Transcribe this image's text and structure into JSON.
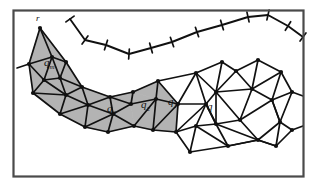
{
  "figure": {
    "kind": "triangulated-mesh-diagram",
    "caption_labels": [
      "r",
      "q_m",
      "q_3",
      "q_2",
      "q_1",
      "q"
    ],
    "background_color": "#ffffff",
    "frame_color": "#4a4a4a",
    "shade_color": "#b3b3b3",
    "edge_color": "#111111",
    "vertex_color": "#111111"
  },
  "frame": {
    "x": 13.5,
    "y": 10.5,
    "width": 290,
    "height": 166,
    "stroke_width": 2.2
  },
  "labels": [
    {
      "name": "label-r",
      "text": "r",
      "x": 36,
      "y": 21,
      "class": "label-r"
    },
    {
      "name": "label-qm",
      "text": "q",
      "sub": "m",
      "x": 44,
      "y": 66,
      "class": "label-main"
    },
    {
      "name": "label-q3",
      "text": "q",
      "sub": "3",
      "x": 107,
      "y": 112,
      "class": "label-main"
    },
    {
      "name": "label-q2",
      "text": "q",
      "sub": "2",
      "x": 141,
      "y": 108,
      "class": "label-main"
    },
    {
      "name": "label-q1",
      "text": "q",
      "sub": "1",
      "x": 168,
      "y": 105,
      "class": "label-main"
    },
    {
      "name": "label-q",
      "text": "q",
      "sub": "",
      "x": 207,
      "y": 110,
      "class": "label-main"
    }
  ],
  "shaded_polygons": [
    [
      [
        40,
        28
      ],
      [
        29,
        64
      ],
      [
        52,
        57
      ]
    ],
    [
      [
        40,
        28
      ],
      [
        52,
        57
      ],
      [
        66,
        62
      ]
    ],
    [
      [
        29,
        64
      ],
      [
        52,
        57
      ],
      [
        44,
        80
      ]
    ],
    [
      [
        52,
        57
      ],
      [
        66,
        62
      ],
      [
        60,
        78
      ]
    ],
    [
      [
        52,
        57
      ],
      [
        60,
        78
      ],
      [
        44,
        80
      ]
    ],
    [
      [
        44,
        80
      ],
      [
        60,
        78
      ],
      [
        66,
        95
      ]
    ],
    [
      [
        29,
        64
      ],
      [
        44,
        80
      ],
      [
        33,
        93
      ]
    ],
    [
      [
        33,
        93
      ],
      [
        44,
        80
      ],
      [
        66,
        95
      ]
    ],
    [
      [
        60,
        78
      ],
      [
        66,
        95
      ],
      [
        82,
        87
      ]
    ],
    [
      [
        66,
        62
      ],
      [
        60,
        78
      ],
      [
        82,
        87
      ]
    ],
    [
      [
        33,
        93
      ],
      [
        66,
        95
      ],
      [
        60,
        114
      ]
    ],
    [
      [
        66,
        95
      ],
      [
        82,
        87
      ],
      [
        88,
        105
      ]
    ],
    [
      [
        66,
        95
      ],
      [
        88,
        105
      ],
      [
        60,
        114
      ]
    ],
    [
      [
        60,
        114
      ],
      [
        88,
        105
      ],
      [
        85,
        127
      ]
    ],
    [
      [
        88,
        105
      ],
      [
        110,
        97
      ],
      [
        113,
        114
      ]
    ],
    [
      [
        82,
        87
      ],
      [
        110,
        97
      ],
      [
        88,
        105
      ]
    ],
    [
      [
        88,
        105
      ],
      [
        113,
        114
      ],
      [
        85,
        127
      ]
    ],
    [
      [
        85,
        127
      ],
      [
        113,
        114
      ],
      [
        108,
        132
      ]
    ],
    [
      [
        110,
        97
      ],
      [
        131,
        104
      ],
      [
        113,
        114
      ]
    ],
    [
      [
        113,
        114
      ],
      [
        131,
        104
      ],
      [
        134,
        126
      ]
    ],
    [
      [
        113,
        114
      ],
      [
        134,
        126
      ],
      [
        108,
        132
      ]
    ],
    [
      [
        110,
        97
      ],
      [
        133,
        92
      ],
      [
        131,
        104
      ]
    ],
    [
      [
        131,
        104
      ],
      [
        156,
        99
      ],
      [
        134,
        126
      ]
    ],
    [
      [
        133,
        92
      ],
      [
        156,
        99
      ],
      [
        131,
        104
      ]
    ],
    [
      [
        134,
        126
      ],
      [
        156,
        99
      ],
      [
        153,
        130
      ]
    ],
    [
      [
        133,
        92
      ],
      [
        158,
        81
      ],
      [
        156,
        99
      ]
    ],
    [
      [
        156,
        99
      ],
      [
        178,
        104
      ],
      [
        153,
        130
      ]
    ],
    [
      [
        156,
        99
      ],
      [
        158,
        81
      ],
      [
        178,
        104
      ]
    ],
    [
      [
        153,
        130
      ],
      [
        178,
        104
      ],
      [
        176,
        132
      ]
    ]
  ],
  "mesh_edges": [
    [
      40,
      28,
      29,
      64
    ],
    [
      40,
      28,
      52,
      57
    ],
    [
      40,
      28,
      66,
      62
    ],
    [
      29,
      64,
      52,
      57
    ],
    [
      52,
      57,
      66,
      62
    ],
    [
      17,
      68,
      29,
      64
    ],
    [
      29,
      64,
      44,
      80
    ],
    [
      52,
      57,
      44,
      80
    ],
    [
      52,
      57,
      60,
      78
    ],
    [
      66,
      62,
      60,
      78
    ],
    [
      44,
      80,
      60,
      78
    ],
    [
      29,
      64,
      33,
      93
    ],
    [
      44,
      80,
      33,
      93
    ],
    [
      44,
      80,
      66,
      95
    ],
    [
      60,
      78,
      66,
      95
    ],
    [
      33,
      93,
      66,
      95
    ],
    [
      60,
      78,
      82,
      87
    ],
    [
      66,
      95,
      82,
      87
    ],
    [
      66,
      62,
      82,
      87
    ],
    [
      33,
      93,
      60,
      114
    ],
    [
      66,
      95,
      60,
      114
    ],
    [
      66,
      95,
      88,
      105
    ],
    [
      82,
      87,
      88,
      105
    ],
    [
      60,
      114,
      88,
      105
    ],
    [
      60,
      114,
      85,
      127
    ],
    [
      88,
      105,
      85,
      127
    ],
    [
      82,
      87,
      110,
      97
    ],
    [
      88,
      105,
      110,
      97
    ],
    [
      88,
      105,
      113,
      114
    ],
    [
      110,
      97,
      113,
      114
    ],
    [
      85,
      127,
      113,
      114
    ],
    [
      85,
      127,
      108,
      132
    ],
    [
      113,
      114,
      108,
      132
    ],
    [
      110,
      97,
      131,
      104
    ],
    [
      113,
      114,
      131,
      104
    ],
    [
      113,
      114,
      134,
      126
    ],
    [
      108,
      132,
      134,
      126
    ],
    [
      110,
      97,
      133,
      92
    ],
    [
      131,
      104,
      133,
      92
    ],
    [
      131,
      104,
      156,
      99
    ],
    [
      134,
      126,
      156,
      99
    ],
    [
      134,
      126,
      153,
      130
    ],
    [
      153,
      130,
      156,
      99
    ],
    [
      133,
      92,
      158,
      81
    ],
    [
      156,
      99,
      158,
      81
    ],
    [
      156,
      99,
      178,
      104
    ],
    [
      153,
      130,
      178,
      104
    ],
    [
      153,
      130,
      176,
      132
    ],
    [
      176,
      132,
      178,
      104
    ],
    [
      158,
      81,
      178,
      104
    ],
    [
      178,
      104,
      206,
      104
    ],
    [
      176,
      132,
      206,
      104
    ],
    [
      178,
      104,
      196,
      73
    ],
    [
      196,
      73,
      206,
      104
    ],
    [
      158,
      81,
      196,
      73
    ],
    [
      196,
      73,
      222,
      62
    ],
    [
      196,
      73,
      216,
      92
    ],
    [
      206,
      104,
      216,
      92
    ],
    [
      222,
      62,
      216,
      92
    ],
    [
      216,
      92,
      236,
      71
    ],
    [
      222,
      62,
      236,
      71
    ],
    [
      236,
      71,
      258,
      60
    ],
    [
      236,
      71,
      252,
      89
    ],
    [
      216,
      92,
      252,
      89
    ],
    [
      252,
      89,
      258,
      60
    ],
    [
      258,
      60,
      281,
      72
    ],
    [
      252,
      89,
      281,
      72
    ],
    [
      252,
      89,
      272,
      100
    ],
    [
      281,
      72,
      272,
      100
    ],
    [
      272,
      100,
      292,
      92
    ],
    [
      281,
      72,
      292,
      92
    ],
    [
      272,
      100,
      280,
      122
    ],
    [
      292,
      92,
      280,
      122
    ],
    [
      206,
      104,
      216,
      124
    ],
    [
      216,
      92,
      216,
      124
    ],
    [
      216,
      124,
      240,
      120
    ],
    [
      216,
      92,
      240,
      120
    ],
    [
      240,
      120,
      252,
      89
    ],
    [
      240,
      120,
      272,
      100
    ],
    [
      240,
      120,
      258,
      140
    ],
    [
      216,
      124,
      258,
      140
    ],
    [
      206,
      104,
      216,
      124
    ],
    [
      216,
      124,
      228,
      146
    ],
    [
      228,
      146,
      258,
      140
    ],
    [
      206,
      104,
      196,
      126
    ],
    [
      196,
      126,
      216,
      124
    ],
    [
      196,
      126,
      228,
      146
    ],
    [
      176,
      132,
      196,
      126
    ],
    [
      176,
      132,
      190,
      152
    ],
    [
      190,
      152,
      196,
      126
    ],
    [
      190,
      152,
      228,
      146
    ],
    [
      258,
      140,
      280,
      122
    ],
    [
      258,
      140,
      276,
      146
    ],
    [
      276,
      146,
      280,
      122
    ],
    [
      276,
      146,
      292,
      130
    ],
    [
      280,
      122,
      292,
      130
    ],
    [
      258,
      140,
      276,
      146
    ],
    [
      272,
      100,
      280,
      122
    ],
    [
      292,
      92,
      303,
      96
    ],
    [
      292,
      130,
      303,
      126
    ],
    [
      228,
      146,
      258,
      140
    ]
  ],
  "upper_polyline": [
    [
      70,
      19
    ],
    [
      85,
      40
    ],
    [
      106,
      45
    ],
    [
      129,
      54
    ],
    [
      151,
      48
    ],
    [
      172,
      42
    ],
    [
      197,
      32
    ],
    [
      222,
      25
    ],
    [
      248,
      17
    ],
    [
      268,
      15
    ],
    [
      288,
      26
    ],
    [
      303,
      37
    ]
  ],
  "mesh_vertices": [
    [
      40,
      28
    ],
    [
      29,
      64
    ],
    [
      52,
      57
    ],
    [
      66,
      62
    ],
    [
      44,
      80
    ],
    [
      60,
      78
    ],
    [
      33,
      93
    ],
    [
      66,
      95
    ],
    [
      82,
      87
    ],
    [
      60,
      114
    ],
    [
      88,
      105
    ],
    [
      85,
      127
    ],
    [
      110,
      97
    ],
    [
      113,
      114
    ],
    [
      108,
      132
    ],
    [
      131,
      104
    ],
    [
      134,
      126
    ],
    [
      133,
      92
    ],
    [
      156,
      99
    ],
    [
      153,
      130
    ],
    [
      158,
      81
    ],
    [
      178,
      104
    ],
    [
      176,
      132
    ],
    [
      196,
      73
    ],
    [
      206,
      104
    ],
    [
      216,
      92
    ],
    [
      222,
      62
    ],
    [
      236,
      71
    ],
    [
      258,
      60
    ],
    [
      252,
      89
    ],
    [
      281,
      72
    ],
    [
      272,
      100
    ],
    [
      292,
      92
    ],
    [
      280,
      122
    ],
    [
      216,
      124
    ],
    [
      240,
      120
    ],
    [
      258,
      140
    ],
    [
      228,
      146
    ],
    [
      196,
      126
    ],
    [
      190,
      152
    ],
    [
      276,
      146
    ],
    [
      292,
      130
    ]
  ],
  "polyline_vertex_ticks": [
    [
      70,
      19
    ],
    [
      85,
      40
    ],
    [
      106,
      45
    ],
    [
      129,
      54
    ],
    [
      151,
      48
    ],
    [
      172,
      42
    ],
    [
      197,
      32
    ],
    [
      222,
      25
    ],
    [
      248,
      17
    ],
    [
      268,
      15
    ],
    [
      288,
      26
    ],
    [
      303,
      37
    ]
  ]
}
